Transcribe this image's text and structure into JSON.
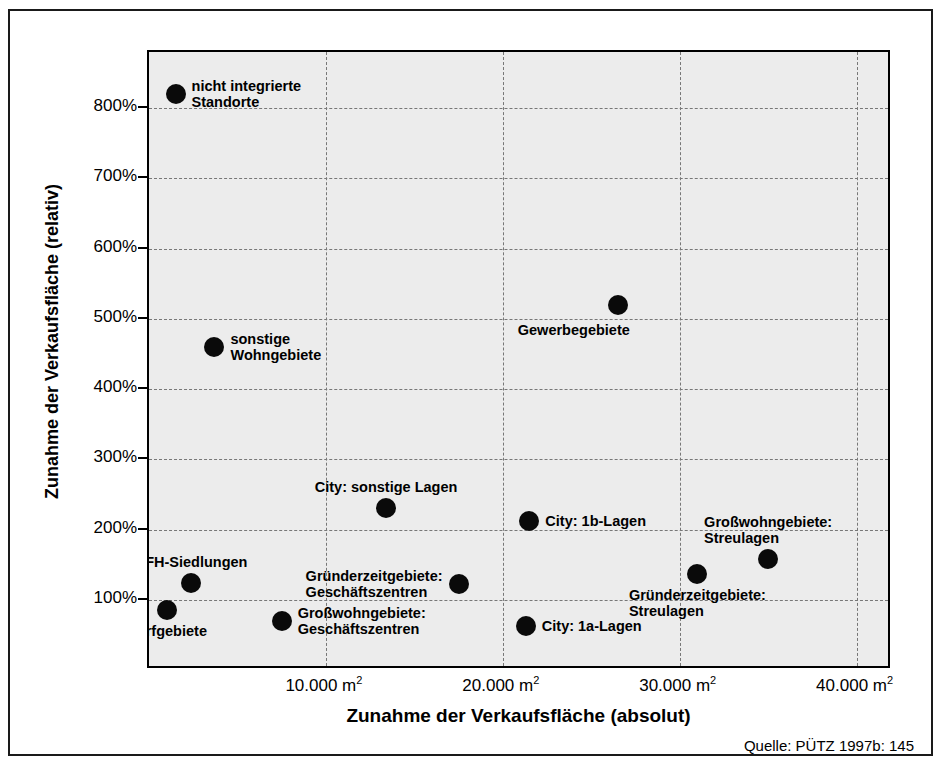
{
  "figure": {
    "source_note": "Quelle: PÜTZ 1997b: 145"
  },
  "chart_data": {
    "type": "scatter",
    "title": "",
    "xlabel": "Zunahme der Verkaufsfläche (absolut)",
    "ylabel": "Zunahme der Verkaufsfläche (relativ)",
    "xlim": [
      0,
      42000
    ],
    "ylim": [
      0,
      880
    ],
    "grid": true,
    "legend_position": "none",
    "x_unit": "m²",
    "y_unit": "%",
    "xticks": [
      10000,
      20000,
      30000,
      40000
    ],
    "xtick_labels": [
      "10.000 m",
      "20.000 m",
      "30.000 m",
      "40.000 m"
    ],
    "xtick_sup": "2",
    "yticks": [
      100,
      200,
      300,
      400,
      500,
      600,
      700,
      800
    ],
    "ytick_labels": [
      "100%",
      "200%",
      "300%",
      "400%",
      "500%",
      "600%",
      "700%",
      "800%"
    ],
    "points": [
      {
        "label": "nicht integrierte\nStandorte",
        "x": 1500,
        "y": 820,
        "label_pos": "right"
      },
      {
        "label": "sonstige\nWohngebiete",
        "x": 3700,
        "y": 460,
        "label_pos": "right"
      },
      {
        "label": "Gewerbegebiete",
        "x": 26500,
        "y": 520,
        "label_pos": "below-left"
      },
      {
        "label": "City: sonstige Lagen",
        "x": 13400,
        "y": 230,
        "label_pos": "above"
      },
      {
        "label": "City: 1b-Lagen",
        "x": 21500,
        "y": 212,
        "label_pos": "right"
      },
      {
        "label": "Großwohngebiete:\nStreulagen",
        "x": 35000,
        "y": 158,
        "label_pos": "above"
      },
      {
        "label": "Gründerzeitgebiete:\nStreulagen",
        "x": 31000,
        "y": 137,
        "label_pos": "below"
      },
      {
        "label": "Gründerzeitgebiete:\nGeschäftszentren",
        "x": 17500,
        "y": 123,
        "label_pos": "left"
      },
      {
        "label": "EFH-Siedlungen",
        "x": 2400,
        "y": 124,
        "label_pos": "above"
      },
      {
        "label": "Dorfgebiete",
        "x": 1000,
        "y": 85,
        "label_pos": "below"
      },
      {
        "label": "Großwohngebiete:\nGeschäftszentren",
        "x": 7500,
        "y": 70,
        "label_pos": "right"
      },
      {
        "label": "City: 1a-Lagen",
        "x": 21300,
        "y": 63,
        "label_pos": "right"
      }
    ]
  }
}
